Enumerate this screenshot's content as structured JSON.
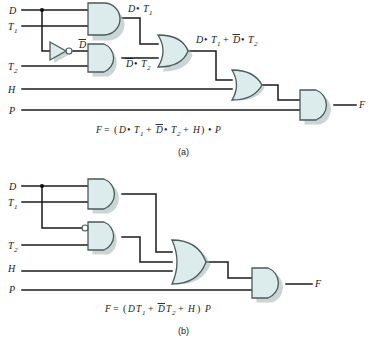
{
  "figure": {
    "panels": [
      {
        "tag": "(a)",
        "inputs": [
          {
            "name": "D",
            "label": "D"
          },
          {
            "name": "T1",
            "label": "T",
            "sub": "1"
          },
          {
            "name": "T2",
            "label": "T",
            "sub": "2"
          },
          {
            "name": "H",
            "label": "H"
          },
          {
            "name": "P",
            "label": "P"
          }
        ],
        "output": {
          "name": "F",
          "label": "F"
        },
        "gates": [
          {
            "id": "and1",
            "type": "AND",
            "inputs": [
              "D",
              "T1"
            ],
            "output_label": "D • T1"
          },
          {
            "id": "inv1",
            "type": "NOT",
            "inputs": [
              "D"
            ],
            "output_label": "Dbar"
          },
          {
            "id": "and2",
            "type": "AND",
            "inputs": [
              "Dbar",
              "T2"
            ],
            "output_label": "Dbar • T2"
          },
          {
            "id": "or1",
            "type": "OR",
            "inputs": [
              "and1",
              "and2"
            ],
            "output_label": "D • T1 + Dbar • T2"
          },
          {
            "id": "or2",
            "type": "OR",
            "inputs": [
              "or1",
              "H"
            ],
            "output_label": ""
          },
          {
            "id": "and3",
            "type": "AND",
            "inputs": [
              "or2",
              "P"
            ],
            "output_label": "F"
          }
        ],
        "wire_labels": {
          "and1_out": {
            "base": "D",
            "op": "•",
            "t": "T",
            "tsub": "1"
          },
          "inv_out": {
            "base": "D",
            "overbar": true
          },
          "and2_out": {
            "base": "D",
            "overbar": true,
            "op": "•",
            "t": "T",
            "tsub": "2"
          },
          "or1_out_left": {
            "base": "D",
            "op": "•",
            "t": "T",
            "tsub": "1"
          },
          "or1_out_plus": "+",
          "or1_out_right": {
            "base": "D",
            "overbar": true,
            "op": "•",
            "t": "T",
            "tsub": "2"
          }
        },
        "equation": {
          "lhs": "F",
          "eq": "=",
          "parts": [
            "(",
            "D",
            "•",
            "T",
            "1",
            "+",
            "D",
            "•",
            "T",
            "2",
            "+",
            "H",
            ")",
            "•",
            "P"
          ],
          "plain": "F = (D • T1 + D̄ • T2 + H) • P"
        }
      },
      {
        "tag": "(b)",
        "inputs": [
          {
            "name": "D",
            "label": "D"
          },
          {
            "name": "T1",
            "label": "T",
            "sub": "1"
          },
          {
            "name": "T2",
            "label": "T",
            "sub": "2"
          },
          {
            "name": "H",
            "label": "H"
          },
          {
            "name": "P",
            "label": "P"
          }
        ],
        "output": {
          "name": "F",
          "label": "F"
        },
        "gates": [
          {
            "id": "and1",
            "type": "AND",
            "inputs": [
              "D",
              "T1"
            ],
            "output_label": ""
          },
          {
            "id": "and2",
            "type": "AND-inv-input",
            "inputs": [
              "D (inverted)",
              "T2"
            ],
            "output_label": ""
          },
          {
            "id": "or1",
            "type": "OR",
            "inputs": [
              "and1",
              "and2",
              "H"
            ],
            "output_label": ""
          },
          {
            "id": "and3",
            "type": "AND",
            "inputs": [
              "or1",
              "P"
            ],
            "output_label": "F"
          }
        ],
        "wire_labels": {},
        "equation": {
          "lhs": "F",
          "eq": "=",
          "plain": "F = (DT1 + D̄T2 + H) P"
        }
      }
    ],
    "colors": {
      "gate_fill": "#dcebeb",
      "gate_stroke": "#4a5a5a",
      "wire": "#1a1a1a",
      "background": "#ffffff"
    }
  }
}
